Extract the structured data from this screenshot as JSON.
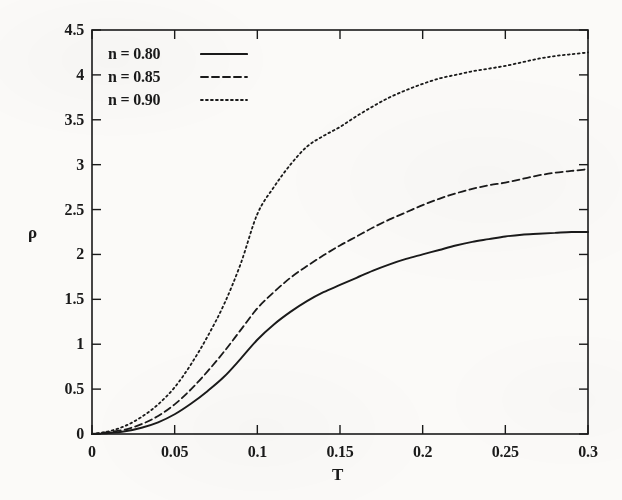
{
  "chart_data": {
    "type": "line",
    "title": "",
    "xlabel": "T",
    "ylabel": "ρ",
    "xlim": [
      0,
      0.3
    ],
    "ylim": [
      0,
      4.5
    ],
    "xticks": [
      "0",
      "0.05",
      "0.1",
      "0.15",
      "0.2",
      "0.25",
      "0.3"
    ],
    "xtick_values": [
      0,
      0.05,
      0.1,
      0.15,
      0.2,
      0.25,
      0.3
    ],
    "yticks": [
      "0",
      "0.5",
      "1",
      "1.5",
      "2",
      "2.5",
      "3",
      "3.5",
      "4",
      "4.5"
    ],
    "ytick_values": [
      0,
      0.5,
      1,
      1.5,
      2,
      2.5,
      3,
      3.5,
      4,
      4.5
    ],
    "grid": false,
    "legend_position": "top-left",
    "line_color": "#1a1a1a",
    "series": [
      {
        "name": "n = 0.80",
        "style": "solid",
        "x": [
          0,
          0.01,
          0.02,
          0.03,
          0.04,
          0.05,
          0.06,
          0.07,
          0.08,
          0.09,
          0.1,
          0.11,
          0.12,
          0.13,
          0.14,
          0.15,
          0.16,
          0.17,
          0.18,
          0.19,
          0.2,
          0.21,
          0.22,
          0.23,
          0.24,
          0.25,
          0.26,
          0.27,
          0.28,
          0.29,
          0.3
        ],
        "values": [
          0,
          0.01,
          0.03,
          0.07,
          0.13,
          0.22,
          0.34,
          0.48,
          0.64,
          0.84,
          1.05,
          1.22,
          1.36,
          1.48,
          1.58,
          1.66,
          1.74,
          1.82,
          1.89,
          1.95,
          2.0,
          2.05,
          2.1,
          2.14,
          2.17,
          2.2,
          2.22,
          2.23,
          2.24,
          2.25,
          2.25
        ]
      },
      {
        "name": "n = 0.85",
        "style": "dashed",
        "x": [
          0,
          0.01,
          0.02,
          0.03,
          0.04,
          0.05,
          0.06,
          0.07,
          0.08,
          0.09,
          0.1,
          0.11,
          0.12,
          0.13,
          0.14,
          0.15,
          0.16,
          0.17,
          0.18,
          0.19,
          0.2,
          0.21,
          0.22,
          0.23,
          0.24,
          0.25,
          0.26,
          0.27,
          0.28,
          0.29,
          0.3
        ],
        "values": [
          0,
          0.02,
          0.05,
          0.11,
          0.2,
          0.33,
          0.5,
          0.7,
          0.92,
          1.16,
          1.4,
          1.58,
          1.74,
          1.87,
          1.99,
          2.1,
          2.2,
          2.3,
          2.39,
          2.47,
          2.55,
          2.62,
          2.68,
          2.73,
          2.77,
          2.8,
          2.84,
          2.88,
          2.91,
          2.93,
          2.95
        ]
      },
      {
        "name": "n = 0.90",
        "style": "dotted",
        "x": [
          0,
          0.01,
          0.02,
          0.03,
          0.04,
          0.05,
          0.06,
          0.07,
          0.08,
          0.09,
          0.1,
          0.11,
          0.12,
          0.13,
          0.14,
          0.15,
          0.16,
          0.17,
          0.18,
          0.19,
          0.2,
          0.21,
          0.22,
          0.23,
          0.24,
          0.25,
          0.26,
          0.27,
          0.28,
          0.29,
          0.3
        ],
        "values": [
          0,
          0.03,
          0.09,
          0.19,
          0.33,
          0.52,
          0.78,
          1.09,
          1.45,
          1.9,
          2.45,
          2.75,
          3.0,
          3.2,
          3.32,
          3.42,
          3.54,
          3.65,
          3.75,
          3.83,
          3.9,
          3.96,
          4.0,
          4.04,
          4.07,
          4.1,
          4.14,
          4.18,
          4.21,
          4.23,
          4.25
        ]
      }
    ]
  },
  "legend": {
    "entries": [
      {
        "label": "n = 0.80",
        "style": "solid"
      },
      {
        "label": "n = 0.85",
        "style": "dashed"
      },
      {
        "label": "n = 0.90",
        "style": "dotted"
      }
    ]
  }
}
